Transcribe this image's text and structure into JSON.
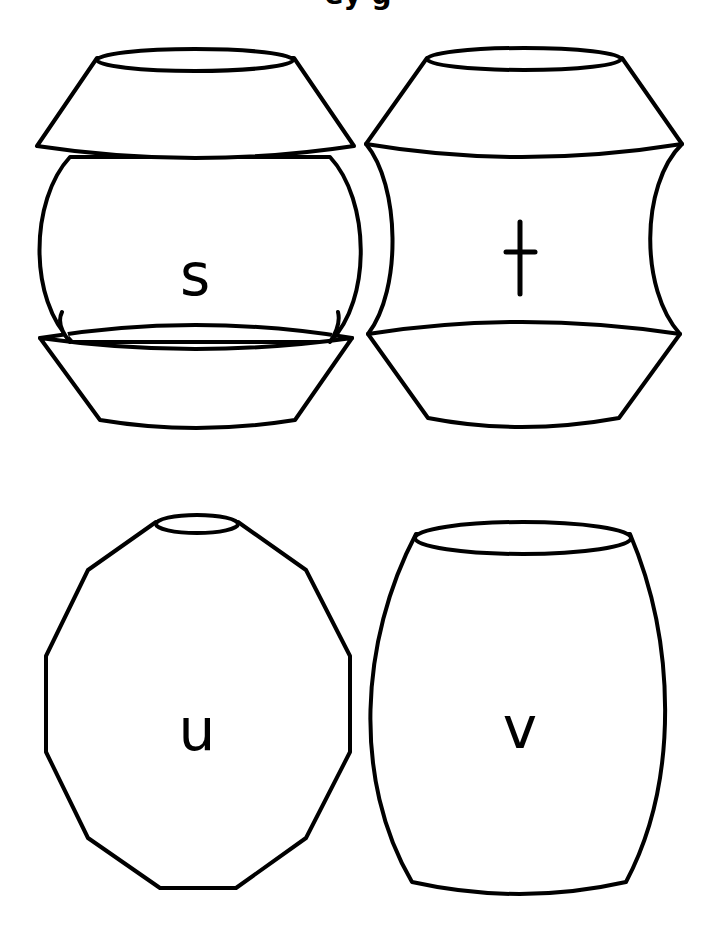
{
  "page": {
    "title_partial": "ey g",
    "background": "#ffffff",
    "stroke_color": "#000000"
  },
  "shapes": [
    {
      "id": "s",
      "label": "s",
      "shape": "sphere-body with conical top and bowl base"
    },
    {
      "id": "t",
      "label": "t",
      "shape": "concave-waisted body with conical top and bottom"
    },
    {
      "id": "u",
      "label": "u",
      "shape": "polygonal (faceted) oval with small neck"
    },
    {
      "id": "v",
      "label": "v",
      "shape": "barrel-shaped vase"
    }
  ]
}
